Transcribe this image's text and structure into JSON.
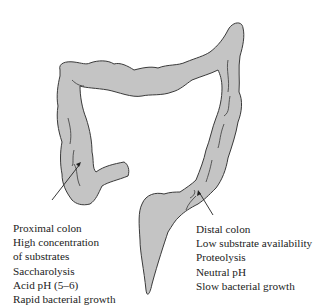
{
  "figure": {
    "subject": "colon",
    "fill_color": "#c4c4c4",
    "outline_color": "#3a3a3a",
    "background": "#ffffff"
  },
  "annotations": {
    "proximal": {
      "lines": [
        "Proximal colon",
        "High concentration",
        "of substrates",
        "Saccharolysis",
        "Acid pH (5–6)",
        "Rapid bacterial growth"
      ]
    },
    "distal": {
      "lines": [
        "Distal colon",
        "Low substrate availability",
        "Proteolysis",
        "Neutral pH",
        "Slow bacterial growth"
      ]
    }
  }
}
